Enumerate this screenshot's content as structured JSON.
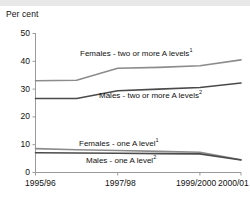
{
  "chart_data": {
    "type": "line",
    "title": "",
    "ylabel": "Per cent",
    "xlabel": "",
    "ylim": [
      0,
      50
    ],
    "yticks": [
      0,
      10,
      20,
      30,
      40,
      50
    ],
    "grid": false,
    "legend_position": "inline-labels",
    "categories": [
      "1995/96",
      "1996/97",
      "1997/98",
      "1998/99",
      "1999/2000",
      "2000/01"
    ],
    "xtick_labels": [
      "1995/96",
      "1997/98",
      "1999/2000",
      "2000/01"
    ],
    "series": [
      {
        "name": "Females - two or more A levels",
        "footnote": "1",
        "label": "Females - two or more A levels",
        "color": "#8c8c8c",
        "values": [
          33.0,
          33.2,
          37.5,
          37.8,
          38.4,
          40.5
        ]
      },
      {
        "name": "Males - two or more A levels",
        "footnote": "2",
        "label": "Males - two or more A levels",
        "color": "#4a4a4a",
        "values": [
          26.6,
          26.6,
          29.4,
          30.0,
          30.6,
          32.2
        ]
      },
      {
        "name": "Females - one A level",
        "footnote": "1",
        "label": "Females - one A level",
        "color": "#8c8c8c",
        "values": [
          8.6,
          8.2,
          7.9,
          7.6,
          7.3,
          4.6
        ]
      },
      {
        "name": "Males - one A level",
        "footnote": "2",
        "label": "Males - one A level",
        "color": "#4a4a4a",
        "values": [
          7.1,
          7.0,
          6.9,
          6.8,
          6.7,
          4.5
        ]
      }
    ]
  },
  "axis": {
    "ylabel_title": "Per cent",
    "yticks": [
      "0",
      "10",
      "20",
      "30",
      "40",
      "50"
    ],
    "xticks": [
      "1995/96",
      "1997/98",
      "1999/2000",
      "2000/01"
    ]
  },
  "labels": {
    "females_two": "Females - two or more A levels",
    "females_two_note": "1",
    "males_two": "Males - two or more A levels",
    "males_two_note": "2",
    "females_one": "Females - one A level",
    "females_one_note": "1",
    "males_one": "Males - one A level",
    "males_one_note": "2"
  },
  "colors": {
    "light_series": "#8c8c8c",
    "dark_series": "#4a4a4a",
    "axis": "#9a9a9a",
    "text": "#111111",
    "top_band": "#e8e8e8"
  }
}
